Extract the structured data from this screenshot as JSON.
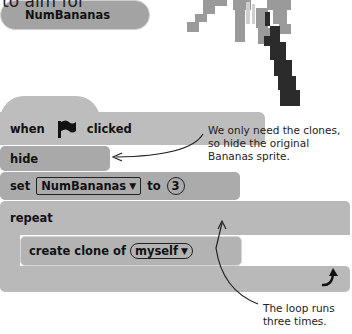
{
  "header": {
    "partial_text": "to aim for"
  },
  "sprite": {
    "icon": "palm-tree-icon"
  },
  "blocks": {
    "hat": {
      "prefix": "when",
      "icon": "green-flag-icon",
      "suffix": "clicked"
    },
    "hide": {
      "label": "hide"
    },
    "set": {
      "label": "set",
      "variable": "NumBananas",
      "to_label": "to",
      "value": "3"
    },
    "repeat": {
      "label": "repeat",
      "count_reporter": "NumBananas",
      "loop_icon": "loop-arrow-icon"
    },
    "create_clone": {
      "label": "create clone of",
      "target": "myself"
    }
  },
  "annotations": {
    "hide_note": "We only need the clones, so hide the original Bananas sprite.",
    "loop_note": "The loop runs three times."
  },
  "colors": {
    "hat_block": "#bdbdbd",
    "hide_block": "#a9a9a9",
    "set_block": "#ababab",
    "repeat_block": "#b9b9b9",
    "reporter": "#a3a3a3",
    "palm_leaves": "#9a9a9a",
    "palm_trunk": "#2b2b2b"
  }
}
